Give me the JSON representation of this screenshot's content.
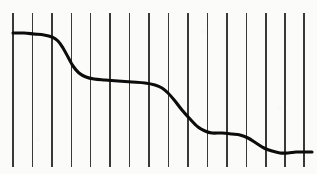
{
  "figure": {
    "title": "",
    "background_color": "#fbfbfa",
    "width": 317,
    "height": 174
  },
  "chart_data": {
    "type": "line",
    "title": "",
    "xlabel": "",
    "ylabel": "",
    "grid": "vertical-only",
    "legend": "none",
    "axis_visible": false,
    "tick_labels_visible": false,
    "series": [
      {
        "name": "curve",
        "color": "#0c0c0c",
        "stroke_width": 3.1,
        "x": [
          13,
          24,
          34,
          44,
          52,
          58,
          63,
          68,
          73,
          79,
          86,
          94,
          105,
          118,
          132,
          145,
          155,
          162,
          168,
          175,
          182,
          190,
          198,
          205,
          212,
          222,
          232,
          240,
          248,
          256,
          264,
          272,
          280,
          288,
          296,
          304,
          312
        ],
        "y": [
          33,
          33,
          34,
          35,
          37,
          41,
          48,
          57,
          66,
          73,
          77,
          79,
          80,
          81,
          82,
          83,
          85,
          88,
          93,
          101,
          110,
          119,
          127,
          131,
          133,
          133,
          134,
          135,
          138,
          143,
          148,
          151,
          153,
          153,
          152,
          152,
          152
        ]
      }
    ],
    "gridlines": {
      "orientation": "vertical",
      "count": 16,
      "color": "#1f1f1f",
      "stroke_width": 1.1,
      "x_positions": [
        13,
        32.5,
        52,
        71.5,
        90.5,
        110,
        129.5,
        149,
        168.5,
        188,
        207.5,
        227,
        246.5,
        266,
        285,
        304
      ],
      "y_top": 13,
      "y_bottom": 167
    },
    "xlim": [
      0,
      317
    ],
    "ylim": [
      174,
      0
    ]
  }
}
